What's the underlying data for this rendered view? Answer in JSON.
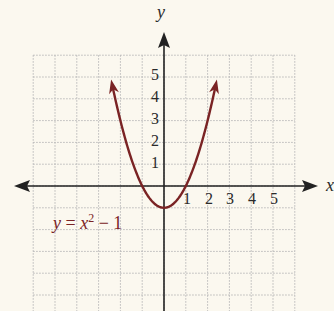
{
  "chart_data": {
    "type": "line",
    "title": "",
    "function": "y = x^2 - 1",
    "equation_label": {
      "lhs": "y",
      "eq": "=",
      "base": "x",
      "exp": "2",
      "rest": "− 1"
    },
    "xlabel": "x",
    "ylabel": "y",
    "xlim": [
      -6,
      6
    ],
    "ylim": [
      -5,
      6
    ],
    "grid": true,
    "grid_style": "dotted",
    "x_tick_labels": [
      "1",
      "2",
      "3",
      "4",
      "5"
    ],
    "y_tick_labels": [
      "1",
      "2",
      "3",
      "4",
      "5"
    ],
    "series": [
      {
        "name": "y = x^2 - 1",
        "color": "#7a2324",
        "x": [
          -2.45,
          -2,
          -1.5,
          -1,
          -0.5,
          0,
          0.5,
          1,
          1.5,
          2,
          2.45
        ],
        "y": [
          5.0,
          3,
          1.25,
          0,
          -0.75,
          -1,
          -0.75,
          0,
          1.25,
          3,
          5.0
        ],
        "vertex": [
          0,
          -1
        ],
        "x_intercepts": [
          -1,
          1
        ],
        "arrows_both_ends": true
      }
    ]
  },
  "colors": {
    "background": "#fbf8ef",
    "curve": "#7a2324",
    "axis": "#222222",
    "grid": "#b8b8b8"
  }
}
